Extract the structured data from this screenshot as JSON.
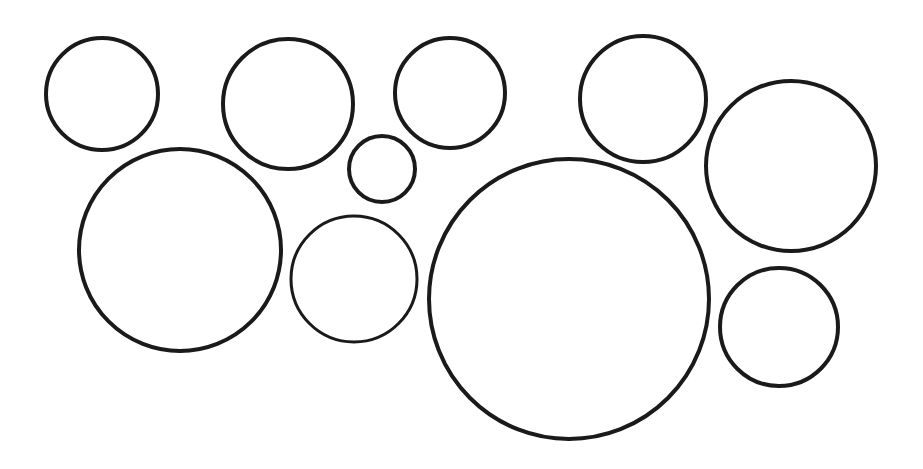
{
  "diagram": {
    "width": 923,
    "height": 469,
    "background": "#ffffff",
    "stroke_color": "#1a1a1a",
    "circles": [
      {
        "id": "circle-1",
        "cx": 102,
        "cy": 94,
        "r": 56,
        "stroke_width": 4
      },
      {
        "id": "circle-2",
        "cx": 288,
        "cy": 104,
        "r": 65,
        "stroke_width": 4
      },
      {
        "id": "circle-3",
        "cx": 382,
        "cy": 169,
        "r": 33,
        "stroke_width": 4
      },
      {
        "id": "circle-4",
        "cx": 450,
        "cy": 93,
        "r": 55,
        "stroke_width": 4
      },
      {
        "id": "circle-5",
        "cx": 643,
        "cy": 99,
        "r": 63,
        "stroke_width": 4
      },
      {
        "id": "circle-6",
        "cx": 791,
        "cy": 166,
        "r": 85,
        "stroke_width": 4
      },
      {
        "id": "circle-7",
        "cx": 180,
        "cy": 250,
        "r": 101,
        "stroke_width": 4
      },
      {
        "id": "circle-8",
        "cx": 354,
        "cy": 279,
        "r": 63,
        "stroke_width": 3
      },
      {
        "id": "circle-9",
        "cx": 569,
        "cy": 299,
        "r": 140,
        "stroke_width": 4
      },
      {
        "id": "circle-10",
        "cx": 779,
        "cy": 327,
        "r": 59,
        "stroke_width": 4
      }
    ]
  }
}
